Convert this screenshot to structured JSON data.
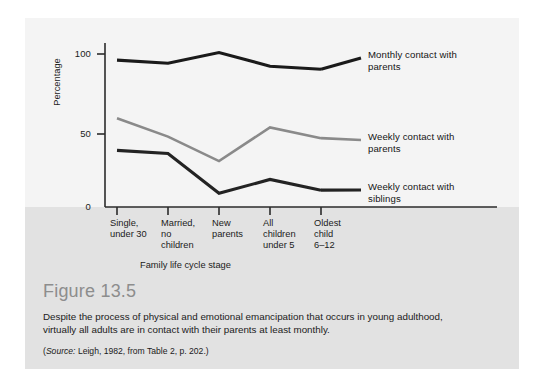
{
  "figure": {
    "number_label": "Figure 13.5",
    "caption": "Despite the process of physical and emotional emancipation that occurs in young adulthood, virtually all adults are in contact with their parents at least monthly.",
    "source_prefix": "(",
    "source_word": "Source:",
    "source_rest": " Leigh, 1982, from Table 2, p. 202.)"
  },
  "chart_data": {
    "type": "line",
    "title": "",
    "xlabel": "Family life cycle stage",
    "ylabel": "Percentage",
    "ylim": [
      0,
      110
    ],
    "y_ticks": [
      0,
      50,
      100
    ],
    "y_tick_labels": [
      "0",
      "50",
      "100"
    ],
    "grid": false,
    "legend_position": "right-inline",
    "categories": [
      "Single,\nunder 30",
      "Married,\nno\nchildren",
      "New\nparents",
      "All\nchildren\nunder 5",
      "Oldest\nchild\n6–12"
    ],
    "series": [
      {
        "name": "Monthly contact with\nparents",
        "values": [
          96,
          94,
          101,
          92,
          90
        ],
        "color": "#1a1a1a",
        "width": 3.1
      },
      {
        "name": "Weekly contact with\nparents",
        "values": [
          58,
          46,
          30,
          52,
          45
        ],
        "color": "#8a8a8a",
        "width": 2.6
      },
      {
        "name": "Weekly contact with\nsiblings",
        "values": [
          37,
          35,
          9,
          18,
          11
        ],
        "color": "#232323",
        "width": 3.1
      }
    ]
  },
  "axis": {
    "tick_0": "0",
    "tick_50": "50",
    "tick_100": "100"
  }
}
